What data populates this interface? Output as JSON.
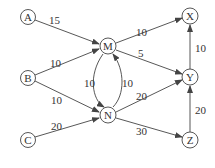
{
  "diagram": {
    "type": "directed-weighted-graph",
    "colors": {
      "stroke": "#444444",
      "text": "#333333",
      "background": "#ffffff"
    },
    "nodes": [
      {
        "id": "A",
        "label": "A",
        "x": 28,
        "y": 17
      },
      {
        "id": "B",
        "label": "B",
        "x": 28,
        "y": 78
      },
      {
        "id": "C",
        "label": "C",
        "x": 28,
        "y": 140
      },
      {
        "id": "M",
        "label": "M",
        "x": 108,
        "y": 46
      },
      {
        "id": "N",
        "label": "N",
        "x": 108,
        "y": 115
      },
      {
        "id": "X",
        "label": "X",
        "x": 190,
        "y": 16
      },
      {
        "id": "Y",
        "label": "Y",
        "x": 190,
        "y": 77
      },
      {
        "id": "Z",
        "label": "Z",
        "x": 190,
        "y": 140
      }
    ],
    "edges": [
      {
        "from": "A",
        "to": "M",
        "weight": "15"
      },
      {
        "from": "B",
        "to": "M",
        "weight": "10"
      },
      {
        "from": "B",
        "to": "N",
        "weight": "10"
      },
      {
        "from": "C",
        "to": "N",
        "weight": "20"
      },
      {
        "from": "M",
        "to": "N",
        "weight": "10"
      },
      {
        "from": "N",
        "to": "M",
        "weight": "10"
      },
      {
        "from": "M",
        "to": "X",
        "weight": "10"
      },
      {
        "from": "M",
        "to": "Y",
        "weight": "5"
      },
      {
        "from": "N",
        "to": "Y",
        "weight": "20"
      },
      {
        "from": "N",
        "to": "Z",
        "weight": "30"
      },
      {
        "from": "Y",
        "to": "X",
        "weight": "10"
      },
      {
        "from": "Z",
        "to": "Y",
        "weight": "20"
      }
    ]
  }
}
